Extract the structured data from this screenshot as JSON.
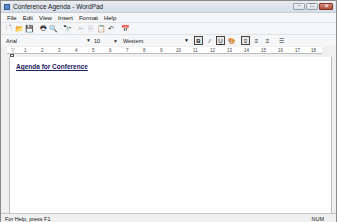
{
  "window": {
    "title": "Conference Agenda - WordPad",
    "controls": {
      "minimize": "–",
      "maximize": "□",
      "close": "✕"
    }
  },
  "menubar": {
    "items": [
      "File",
      "Edit",
      "View",
      "Insert",
      "Format",
      "Help"
    ]
  },
  "toolbar": {
    "icons": [
      {
        "name": "new-icon",
        "glyph": "🗋"
      },
      {
        "name": "open-icon",
        "glyph": "📂"
      },
      {
        "name": "save-icon",
        "glyph": "💾"
      },
      {
        "name": "print-icon",
        "glyph": "🖶"
      },
      {
        "name": "print-preview-icon",
        "glyph": "🔍"
      },
      {
        "name": "find-icon",
        "glyph": "🔭"
      },
      {
        "name": "cut-icon",
        "glyph": "✂"
      },
      {
        "name": "copy-icon",
        "glyph": "⎘"
      },
      {
        "name": "paste-icon",
        "glyph": "📋"
      },
      {
        "name": "undo-icon",
        "glyph": "↶"
      },
      {
        "name": "insert-date-icon",
        "glyph": "📅"
      }
    ]
  },
  "formatbar": {
    "font": "Arial",
    "size": "10",
    "script": "Western",
    "buttons": {
      "bold": "B",
      "italic": "/",
      "underline": "U",
      "color": "🎨",
      "align_left": "≡",
      "align_center": "≡",
      "align_right": "≡",
      "bullets": "☰"
    }
  },
  "ruler": {
    "labels": [
      "1",
      "2",
      "3",
      "4",
      "5",
      "6",
      "7",
      "8",
      "9",
      "10",
      "11",
      "12",
      "13",
      "14",
      "15",
      "16",
      "17",
      "18"
    ]
  },
  "document": {
    "text": "Agenda for Conference"
  },
  "statusbar": {
    "help": "For Help, press F1",
    "num": "NUM"
  }
}
